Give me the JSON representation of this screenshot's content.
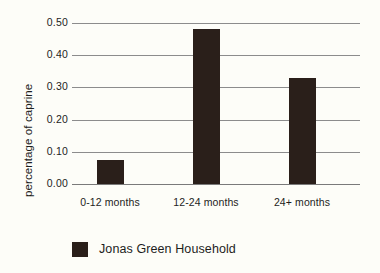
{
  "chart_data": {
    "type": "bar",
    "title": "",
    "subtitle": "",
    "xlabel": "",
    "ylabel": "percentage of caprine",
    "categories": [
      "0-12 months",
      "12-24 months",
      "24+ months"
    ],
    "values": [
      0.075,
      0.48,
      0.33
    ],
    "series": [
      {
        "name": "Jonas Green Household",
        "values": [
          0.075,
          0.48,
          0.33
        ],
        "color": "#2a1f1a"
      }
    ],
    "ylim": [
      0.0,
      0.5
    ],
    "ytick_labels": [
      "0.50",
      "0.40",
      "0.30",
      "0.20",
      "0.10",
      "0.00"
    ],
    "ytick_values": [
      0.5,
      0.4,
      0.3,
      0.2,
      0.1,
      0.0
    ],
    "grid": true,
    "grid_axis": "y",
    "legend": {
      "position": "bottom",
      "entries": [
        {
          "label": "Jonas Green Household",
          "color": "#2a1f1a"
        }
      ]
    },
    "colors": {
      "bar": "#2a1f1a",
      "background": "#fdfdf8",
      "gridline": "#8c8c8c",
      "text": "#1d1d1d"
    }
  }
}
